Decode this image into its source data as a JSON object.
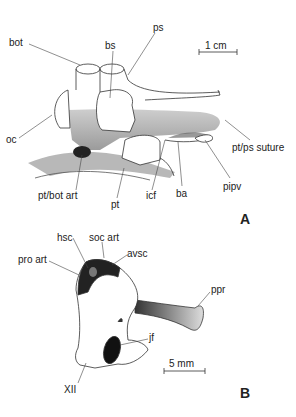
{
  "figure": {
    "panel_a": {
      "letter": "A",
      "scale_bar": "1 cm",
      "labels": {
        "bot": "bot",
        "bs": "bs",
        "ps": "ps",
        "oc": "oc",
        "pt_ps_suture": "pt/ps suture",
        "pt_bot_art": "pt/bot art",
        "pt": "pt",
        "icf": "icf",
        "ba": "ba",
        "pipv": "pipv"
      }
    },
    "panel_b": {
      "letter": "B",
      "scale_bar": "5 mm",
      "labels": {
        "hsc": "hsc",
        "soc_art": "soc art",
        "pro_art": "pro art",
        "avsc": "avsc",
        "ppr": "ppr",
        "jf": "jf",
        "xii": "XII"
      }
    }
  }
}
